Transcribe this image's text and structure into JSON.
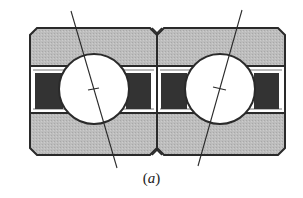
{
  "figure": {
    "type": "paired angular contact ball bearings (face-to-face arrangement)",
    "caption": {
      "open": "(",
      "letter": "a",
      "close": ")"
    },
    "colors": {
      "background": "#ffffff",
      "ring_fill": "#b8b8b8",
      "outline": "#2a2a2a",
      "seal_fill": "#333333",
      "ball_fill": "#ffffff",
      "contact_line": "#2a2a2a"
    },
    "bearings": [
      {
        "id": "left",
        "outer": {
          "x1": 30,
          "y1": 28,
          "x2": 157,
          "y2": 155,
          "chamfer": 7
        },
        "upper_divider_y": 66,
        "lower_divider_y": 113,
        "seals": [
          {
            "x": 35,
            "y": 73,
            "w": 28,
            "h": 36
          },
          {
            "x": 126,
            "y": 73,
            "w": 25,
            "h": 36
          }
        ],
        "ball": {
          "cx": 94,
          "cy": 89,
          "r": 35
        },
        "contact_line": {
          "x1": 71,
          "y1": 11,
          "x2": 117,
          "y2": 168
        }
      },
      {
        "id": "right",
        "outer": {
          "x1": 157,
          "y1": 28,
          "x2": 285,
          "y2": 155,
          "chamfer": 7
        },
        "upper_divider_y": 66,
        "lower_divider_y": 113,
        "seals": [
          {
            "x": 161,
            "y": 73,
            "w": 26,
            "h": 36
          },
          {
            "x": 254,
            "y": 73,
            "w": 25,
            "h": 36
          }
        ],
        "ball": {
          "cx": 220,
          "cy": 89,
          "r": 35
        },
        "contact_line": {
          "x1": 242,
          "y1": 10,
          "x2": 198,
          "y2": 166
        }
      }
    ]
  }
}
